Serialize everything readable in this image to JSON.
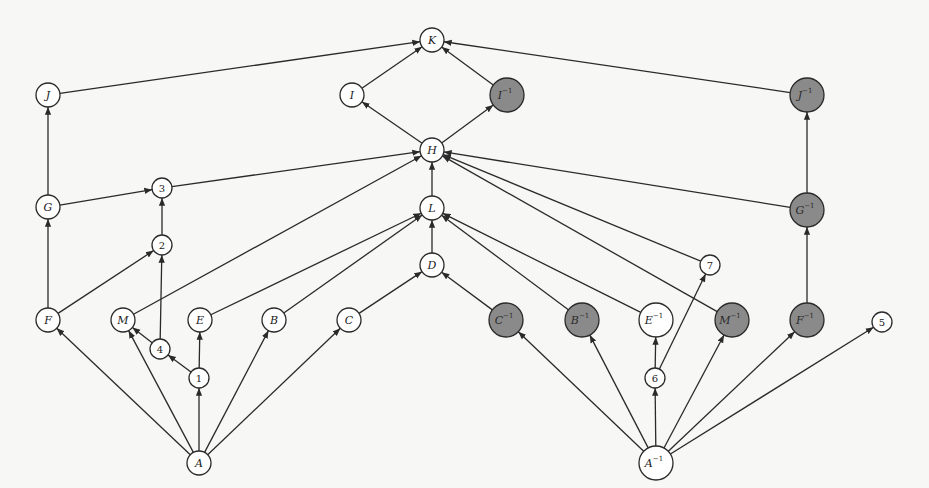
{
  "diagram": {
    "title": "",
    "colors": {
      "background": "#f7f7f5",
      "stroke": "#2a2a2a",
      "gray_fill": "#8a8a8a",
      "white_fill": "#ffffff"
    },
    "nodes": [
      {
        "id": "K",
        "label": "K",
        "sup": "",
        "x": 432,
        "y": 40,
        "r": 12,
        "fill": "white"
      },
      {
        "id": "I",
        "label": "I",
        "sup": "",
        "x": 352,
        "y": 95,
        "r": 12,
        "fill": "white"
      },
      {
        "id": "Iinv",
        "label": "I",
        "sup": "−1",
        "x": 507,
        "y": 95,
        "r": 17,
        "fill": "gray"
      },
      {
        "id": "J",
        "label": "J",
        "sup": "",
        "x": 48,
        "y": 95,
        "r": 12,
        "fill": "white"
      },
      {
        "id": "Jinv",
        "label": "J",
        "sup": "−1",
        "x": 807,
        "y": 95,
        "r": 17,
        "fill": "gray"
      },
      {
        "id": "H",
        "label": "H",
        "sup": "",
        "x": 432,
        "y": 150,
        "r": 12,
        "fill": "white"
      },
      {
        "id": "L",
        "label": "L",
        "sup": "",
        "x": 432,
        "y": 208,
        "r": 12,
        "fill": "white"
      },
      {
        "id": "D",
        "label": "D",
        "sup": "",
        "x": 432,
        "y": 265,
        "r": 12,
        "fill": "white"
      },
      {
        "id": "G",
        "label": "G",
        "sup": "",
        "x": 48,
        "y": 207,
        "r": 12,
        "fill": "white"
      },
      {
        "id": "n3",
        "label": "3",
        "sup": "",
        "x": 162,
        "y": 188,
        "r": 10,
        "fill": "white",
        "numeric": true
      },
      {
        "id": "n2",
        "label": "2",
        "sup": "",
        "x": 162,
        "y": 245,
        "r": 10,
        "fill": "white",
        "numeric": true
      },
      {
        "id": "Ginv",
        "label": "G",
        "sup": "−1",
        "x": 807,
        "y": 210,
        "r": 17,
        "fill": "gray"
      },
      {
        "id": "F",
        "label": "F",
        "sup": "",
        "x": 48,
        "y": 320,
        "r": 12,
        "fill": "white"
      },
      {
        "id": "M",
        "label": "M",
        "sup": "",
        "x": 123,
        "y": 320,
        "r": 12,
        "fill": "white"
      },
      {
        "id": "E",
        "label": "E",
        "sup": "",
        "x": 200,
        "y": 320,
        "r": 12,
        "fill": "white"
      },
      {
        "id": "B",
        "label": "B",
        "sup": "",
        "x": 274,
        "y": 320,
        "r": 12,
        "fill": "white"
      },
      {
        "id": "C",
        "label": "C",
        "sup": "",
        "x": 349,
        "y": 320,
        "r": 12,
        "fill": "white"
      },
      {
        "id": "n4",
        "label": "4",
        "sup": "",
        "x": 160,
        "y": 349,
        "r": 10,
        "fill": "white",
        "numeric": true
      },
      {
        "id": "n1",
        "label": "1",
        "sup": "",
        "x": 199,
        "y": 378,
        "r": 10,
        "fill": "white",
        "numeric": true
      },
      {
        "id": "A",
        "label": "A",
        "sup": "",
        "x": 199,
        "y": 463,
        "r": 12,
        "fill": "white"
      },
      {
        "id": "Cinv",
        "label": "C",
        "sup": "−1",
        "x": 506,
        "y": 320,
        "r": 17,
        "fill": "gray"
      },
      {
        "id": "Binv",
        "label": "B",
        "sup": "−1",
        "x": 582,
        "y": 320,
        "r": 17,
        "fill": "gray"
      },
      {
        "id": "Einv",
        "label": "E",
        "sup": "−1",
        "x": 656,
        "y": 320,
        "r": 17,
        "fill": "white"
      },
      {
        "id": "Minv",
        "label": "M",
        "sup": "−1",
        "x": 732,
        "y": 320,
        "r": 17,
        "fill": "gray"
      },
      {
        "id": "Finv",
        "label": "F",
        "sup": "−1",
        "x": 807,
        "y": 320,
        "r": 17,
        "fill": "gray"
      },
      {
        "id": "n5",
        "label": "5",
        "sup": "",
        "x": 882,
        "y": 322,
        "r": 10,
        "fill": "white",
        "numeric": true
      },
      {
        "id": "n7",
        "label": "7",
        "sup": "",
        "x": 710,
        "y": 265,
        "r": 10,
        "fill": "white",
        "numeric": true
      },
      {
        "id": "n6",
        "label": "6",
        "sup": "",
        "x": 655,
        "y": 378,
        "r": 10,
        "fill": "white",
        "numeric": true
      },
      {
        "id": "Ainv",
        "label": "A",
        "sup": "−1",
        "x": 656,
        "y": 463,
        "r": 17,
        "fill": "white"
      }
    ],
    "edges": [
      {
        "from": "J",
        "to": "K"
      },
      {
        "from": "I",
        "to": "K"
      },
      {
        "from": "Iinv",
        "to": "K"
      },
      {
        "from": "Jinv",
        "to": "K"
      },
      {
        "from": "H",
        "to": "I"
      },
      {
        "from": "H",
        "to": "Iinv"
      },
      {
        "from": "n3",
        "to": "H"
      },
      {
        "from": "L",
        "to": "H"
      },
      {
        "from": "Ginv",
        "to": "H"
      },
      {
        "from": "n7",
        "to": "H"
      },
      {
        "from": "M",
        "to": "H"
      },
      {
        "from": "Minv",
        "to": "H"
      },
      {
        "from": "D",
        "to": "L"
      },
      {
        "from": "E",
        "to": "L"
      },
      {
        "from": "B",
        "to": "L"
      },
      {
        "from": "Einv",
        "to": "L"
      },
      {
        "from": "Binv",
        "to": "L"
      },
      {
        "from": "C",
        "to": "D"
      },
      {
        "from": "Cinv",
        "to": "D"
      },
      {
        "from": "G",
        "to": "J"
      },
      {
        "from": "G",
        "to": "n3"
      },
      {
        "from": "n2",
        "to": "n3"
      },
      {
        "from": "F",
        "to": "G"
      },
      {
        "from": "F",
        "to": "n2"
      },
      {
        "from": "n4",
        "to": "n2"
      },
      {
        "from": "n1",
        "to": "n4"
      },
      {
        "from": "n1",
        "to": "E"
      },
      {
        "from": "n4",
        "to": "M"
      },
      {
        "from": "A",
        "to": "F"
      },
      {
        "from": "A",
        "to": "M"
      },
      {
        "from": "A",
        "to": "n1"
      },
      {
        "from": "A",
        "to": "B"
      },
      {
        "from": "A",
        "to": "C"
      },
      {
        "from": "Ginv",
        "to": "Jinv"
      },
      {
        "from": "Finv",
        "to": "Ginv"
      },
      {
        "from": "Ainv",
        "to": "Cinv"
      },
      {
        "from": "Ainv",
        "to": "Binv"
      },
      {
        "from": "Ainv",
        "to": "n6"
      },
      {
        "from": "Ainv",
        "to": "Minv"
      },
      {
        "from": "Ainv",
        "to": "Finv"
      },
      {
        "from": "Ainv",
        "to": "n5"
      },
      {
        "from": "n6",
        "to": "Einv"
      },
      {
        "from": "n6",
        "to": "n7"
      }
    ]
  }
}
